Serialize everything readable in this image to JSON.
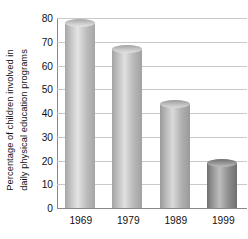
{
  "chart_data": {
    "type": "bar",
    "title": "",
    "subtitle": "",
    "xlabel": "",
    "ylabel": "Percentage of children involved in daily physical education programs",
    "ylabel_lines": [
      "Percentage of children involved in",
      "daily physical education programs"
    ],
    "categories": [
      "1969",
      "1979",
      "1989",
      "1999"
    ],
    "values": [
      78,
      67,
      44,
      19
    ],
    "series": [
      {
        "name": "Percentage of children in daily physical education",
        "values": [
          78,
          67,
          44,
          19
        ]
      }
    ],
    "ylim": [
      0,
      80
    ],
    "ytick_values": [
      0,
      10,
      20,
      30,
      40,
      50,
      60,
      70,
      80
    ],
    "ytick_labels": [
      "0",
      "10",
      "20",
      "30",
      "40",
      "50",
      "60",
      "70",
      "80"
    ],
    "xtick_labels": [
      "1969",
      "1979",
      "1989",
      "1999"
    ],
    "grid": true,
    "grid_axis": "y",
    "legend": false,
    "legend_position": "none",
    "annotations": [],
    "bar_style": "3d-cylinder",
    "bar_colors": [
      "#bcbcbc",
      "#b8b8b8",
      "#b0b0b0",
      "#8e8e8e"
    ],
    "bar_highlight_colors": [
      "#e4e4e4",
      "#e0e0e0",
      "#dadada",
      "#bdbdbd"
    ],
    "bar_shadow_colors": [
      "#a6a6a6",
      "#a2a2a2",
      "#9a9a9a",
      "#6f6f6f"
    ],
    "bar_top_colors": [
      "#cfcfcf",
      "#cbcbcb",
      "#c3c3c3",
      "#9d9d9d"
    ],
    "grid_color": "#c9c9c9",
    "axis_color": "#8a8a8a",
    "text_color": "#111111",
    "background_color": "#ffffff"
  }
}
